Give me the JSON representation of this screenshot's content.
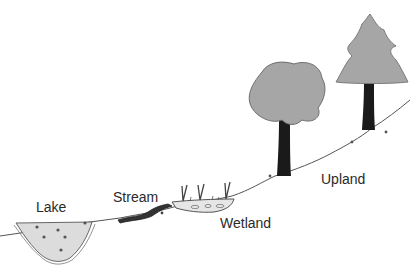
{
  "diagram": {
    "title": "",
    "labels": {
      "lake": "Lake",
      "stream": "Stream",
      "wetland": "Wetland",
      "upland": "Upland"
    },
    "colors": {
      "foliage": "#a6a6a6",
      "trunk": "#1a1a1a",
      "water": "#dcdcdc",
      "line": "#444444",
      "stream": "#333333"
    }
  }
}
